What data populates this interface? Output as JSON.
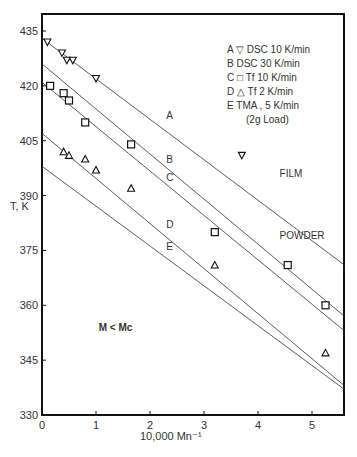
{
  "chart_data": {
    "type": "scatter",
    "title": "",
    "xlabel": "10,000 Mn⁻¹",
    "ylabel": "T, K",
    "xlim": [
      0,
      5.6
    ],
    "ylim": [
      330,
      440
    ],
    "xticks": [
      0,
      1,
      2,
      3,
      4,
      5
    ],
    "yticks": [
      330,
      345,
      360,
      375,
      390,
      405,
      420,
      435
    ],
    "grid": false,
    "legend_position": "top-right",
    "legend": [
      {
        "key": "A",
        "marker": "▽",
        "text": "DSC  10 K/min"
      },
      {
        "key": "B",
        "marker": "",
        "text": "DSC  30 K/min"
      },
      {
        "key": "C",
        "marker": "□",
        "text": "Tf  10 K/min"
      },
      {
        "key": "D",
        "marker": "△",
        "text": "Tf   2 K/min"
      },
      {
        "key": "E",
        "marker": "",
        "text": "TMA  , 5 K/min"
      },
      {
        "key": "",
        "marker": "",
        "text": "(2g Load)"
      }
    ],
    "lines": [
      {
        "name": "A",
        "x": [
          0,
          5.6
        ],
        "y": [
          433,
          371
        ],
        "label_at": [
          2.3,
          411
        ]
      },
      {
        "name": "B",
        "x": [
          0,
          5.6
        ],
        "y": [
          426,
          357
        ],
        "label_at": [
          2.3,
          399
        ]
      },
      {
        "name": "C",
        "x": [
          0,
          5.6
        ],
        "y": [
          421,
          353
        ],
        "label_at": [
          2.3,
          394
        ]
      },
      {
        "name": "D",
        "x": [
          0,
          5.6
        ],
        "y": [
          407,
          338
        ],
        "label_at": [
          2.3,
          381
        ]
      },
      {
        "name": "E",
        "x": [
          0,
          5.6
        ],
        "y": [
          398,
          337
        ],
        "label_at": [
          2.3,
          375
        ]
      }
    ],
    "series": [
      {
        "name": "A - DSC 10 K/min",
        "marker": "triangle-down",
        "x": [
          0.1,
          0.37,
          0.46,
          0.57,
          1.0,
          3.7
        ],
        "y": [
          432,
          429,
          427,
          427,
          422,
          401
        ]
      },
      {
        "name": "C - Tf 10 K/min",
        "marker": "square",
        "x": [
          0.15,
          0.4,
          0.5,
          0.8,
          1.65,
          3.2,
          4.55,
          5.25
        ],
        "y": [
          420,
          418,
          416,
          410,
          404,
          380,
          371,
          360
        ]
      },
      {
        "name": "D - Tf 2 K/min",
        "marker": "triangle-up",
        "x": [
          0.4,
          0.5,
          0.8,
          1.0,
          1.65,
          3.2,
          5.25
        ],
        "y": [
          402,
          401,
          400,
          397,
          392,
          371,
          347
        ]
      }
    ],
    "annotations": [
      {
        "text": "FILM",
        "x": 4.4,
        "y": 395
      },
      {
        "text": "POWDER",
        "x": 4.4,
        "y": 378
      },
      {
        "text": "M < Mc",
        "x": 1.05,
        "y": 353
      }
    ]
  }
}
